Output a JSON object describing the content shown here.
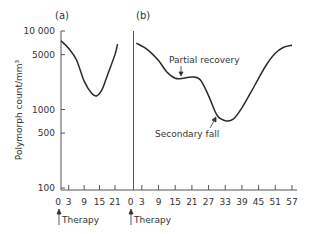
{
  "chart_data": {
    "type": "line",
    "title": "",
    "ylabel": "Polymorph count/mm³",
    "yscale": "log",
    "ylim": [
      100,
      10000
    ],
    "yticks": [
      10000,
      5000,
      1000,
      500,
      100
    ],
    "ytick_labels": [
      "10 000",
      "5000",
      "1000",
      "500",
      "100"
    ],
    "grid": false,
    "panels": [
      {
        "label": "(a)",
        "xticks": [
          0,
          3,
          9,
          15,
          21
        ],
        "xlim": [
          0,
          24
        ],
        "annotation_start": "Therapy",
        "series": [
          {
            "name": "Polymorph count (a)",
            "x": [
              0,
              3,
              6,
              9,
              12,
              14,
              16,
              18,
              21,
              22
            ],
            "y": [
              7500,
              6000,
              4300,
              2300,
              1600,
              1500,
              1800,
              2700,
              5000,
              6800
            ]
          }
        ],
        "annotations": []
      },
      {
        "label": "(b)",
        "xticks": [
          0,
          3,
          9,
          15,
          21,
          27,
          33,
          39,
          45,
          51,
          57
        ],
        "xlim": [
          0,
          58
        ],
        "annotation_start": "Therapy",
        "series": [
          {
            "name": "Polymorph count (b)",
            "x": [
              1,
              5,
              9,
              12,
              15,
              18,
              21,
              24,
              27,
              30,
              33,
              36,
              39,
              42,
              45,
              48,
              51,
              54,
              57
            ],
            "y": [
              7000,
              5800,
              4200,
              3000,
              2500,
              2500,
              2600,
              2400,
              1500,
              850,
              720,
              760,
              1050,
              1600,
              2500,
              3800,
              5200,
              6200,
              6600
            ]
          }
        ],
        "annotations": [
          {
            "text": "Partial recovery",
            "x": 17,
            "y": 2500
          },
          {
            "text": "Secondary fall",
            "x": 30,
            "y": 800
          }
        ]
      }
    ]
  },
  "labels": {
    "panel_a": "(a)",
    "panel_b": "(b)",
    "ylabel": "Polymorph count/mm³",
    "therapy_a": "Therapy",
    "therapy_b": "Therapy",
    "partial_recovery": "Partial recovery",
    "secondary_fall": "Secondary fall"
  },
  "colors": {
    "line": "#2a2a2a",
    "axis": "#555555",
    "text": "#333333"
  }
}
